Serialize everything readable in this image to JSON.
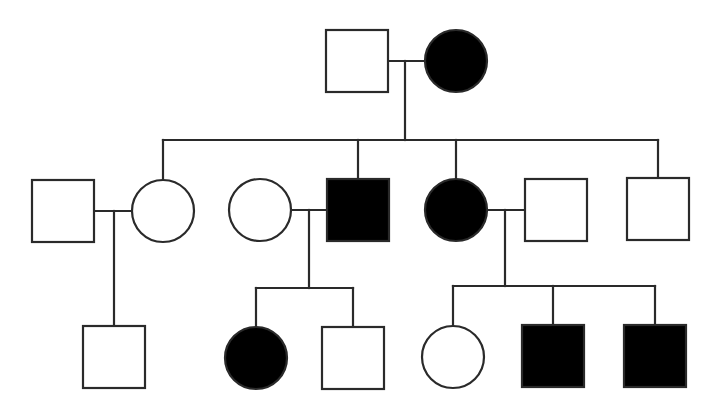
{
  "diagram": {
    "type": "pedigree",
    "title": "",
    "legend": {
      "square": "male",
      "circle": "female",
      "filled": "affected",
      "unfilled": "unaffected"
    },
    "colors": {
      "affected": "#000000",
      "unaffected": "#ffffff",
      "stroke": "#2a2a2a"
    },
    "individuals": [
      {
        "id": "I-1",
        "generation": 1,
        "sex": "male",
        "affected": false,
        "x": 357,
        "y": 61
      },
      {
        "id": "I-2",
        "generation": 1,
        "sex": "female",
        "affected": true,
        "x": 456,
        "y": 61
      },
      {
        "id": "II-1",
        "generation": 2,
        "sex": "male",
        "affected": false,
        "x": 63,
        "y": 211,
        "spouse_in": true
      },
      {
        "id": "II-2",
        "generation": 2,
        "sex": "female",
        "affected": false,
        "x": 163,
        "y": 211
      },
      {
        "id": "II-3",
        "generation": 2,
        "sex": "female",
        "affected": false,
        "x": 260,
        "y": 210,
        "spouse_in": true
      },
      {
        "id": "II-4",
        "generation": 2,
        "sex": "male",
        "affected": true,
        "x": 358,
        "y": 210
      },
      {
        "id": "II-5",
        "generation": 2,
        "sex": "female",
        "affected": true,
        "x": 456,
        "y": 210
      },
      {
        "id": "II-6",
        "generation": 2,
        "sex": "male",
        "affected": false,
        "x": 556,
        "y": 210,
        "spouse_in": true
      },
      {
        "id": "II-7",
        "generation": 2,
        "sex": "male",
        "affected": false,
        "x": 658,
        "y": 209
      },
      {
        "id": "III-1",
        "generation": 3,
        "sex": "male",
        "affected": false,
        "x": 114,
        "y": 357
      },
      {
        "id": "III-2",
        "generation": 3,
        "sex": "female",
        "affected": true,
        "x": 256,
        "y": 358
      },
      {
        "id": "III-3",
        "generation": 3,
        "sex": "male",
        "affected": false,
        "x": 353,
        "y": 358
      },
      {
        "id": "III-4",
        "generation": 3,
        "sex": "female",
        "affected": false,
        "x": 453,
        "y": 357
      },
      {
        "id": "III-5",
        "generation": 3,
        "sex": "male",
        "affected": true,
        "x": 553,
        "y": 356
      },
      {
        "id": "III-6",
        "generation": 3,
        "sex": "male",
        "affected": true,
        "x": 655,
        "y": 356
      }
    ],
    "lines": [
      {
        "kind": "marriage",
        "between": [
          "I-1",
          "I-2"
        ],
        "x1": 388,
        "y1": 61,
        "x2": 425,
        "y2": 61
      },
      {
        "kind": "descent",
        "x1": 405,
        "y1": 61,
        "x2": 405,
        "y2": 140
      },
      {
        "kind": "sibship",
        "x1": 163,
        "y1": 140,
        "x2": 658,
        "y2": 140
      },
      {
        "kind": "drop",
        "to": "II-2",
        "x1": 163,
        "y1": 140,
        "x2": 163,
        "y2": 181
      },
      {
        "kind": "drop",
        "to": "II-4",
        "x1": 358,
        "y1": 140,
        "x2": 358,
        "y2": 179
      },
      {
        "kind": "drop",
        "to": "II-5",
        "x1": 456,
        "y1": 140,
        "x2": 456,
        "y2": 178
      },
      {
        "kind": "drop",
        "to": "II-7",
        "x1": 658,
        "y1": 140,
        "x2": 658,
        "y2": 178
      },
      {
        "kind": "marriage",
        "between": [
          "II-1",
          "II-2"
        ],
        "x1": 94,
        "y1": 211,
        "x2": 133,
        "y2": 211
      },
      {
        "kind": "descent",
        "x1": 114,
        "y1": 211,
        "x2": 114,
        "y2": 326
      },
      {
        "kind": "marriage",
        "between": [
          "II-3",
          "II-4"
        ],
        "x1": 291,
        "y1": 210,
        "x2": 327,
        "y2": 210
      },
      {
        "kind": "descent",
        "x1": 309,
        "y1": 210,
        "x2": 309,
        "y2": 288
      },
      {
        "kind": "sibship",
        "x1": 256,
        "y1": 288,
        "x2": 353,
        "y2": 288
      },
      {
        "kind": "drop",
        "to": "III-2",
        "x1": 256,
        "y1": 288,
        "x2": 256,
        "y2": 326
      },
      {
        "kind": "drop",
        "to": "III-3",
        "x1": 353,
        "y1": 288,
        "x2": 353,
        "y2": 327
      },
      {
        "kind": "marriage",
        "between": [
          "II-5",
          "II-6"
        ],
        "x1": 488,
        "y1": 210,
        "x2": 525,
        "y2": 210
      },
      {
        "kind": "descent",
        "x1": 505,
        "y1": 210,
        "x2": 505,
        "y2": 286
      },
      {
        "kind": "sibship",
        "x1": 453,
        "y1": 286,
        "x2": 655,
        "y2": 286
      },
      {
        "kind": "drop",
        "to": "III-4",
        "x1": 453,
        "y1": 286,
        "x2": 453,
        "y2": 326
      },
      {
        "kind": "drop",
        "to": "III-5",
        "x1": 553,
        "y1": 286,
        "x2": 553,
        "y2": 325
      },
      {
        "kind": "drop",
        "to": "III-6",
        "x1": 655,
        "y1": 286,
        "x2": 655,
        "y2": 325
      }
    ],
    "symbol_size": 62
  }
}
